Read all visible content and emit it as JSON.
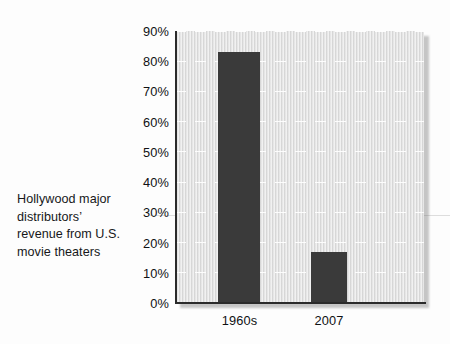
{
  "caption": {
    "lines": [
      "Hollywood major",
      "distributors’",
      "revenue from U.S.",
      "movie theaters"
    ]
  },
  "chart_data": {
    "type": "bar",
    "title": "",
    "subtitle": "",
    "xlabel": "",
    "ylabel": "",
    "categories": [
      "1960s",
      "2007"
    ],
    "values": [
      83,
      17
    ],
    "ylim": [
      0,
      90
    ],
    "ytick_labels": [
      "0%",
      "10%",
      "20%",
      "30%",
      "40%",
      "50%",
      "60%",
      "70%",
      "80%",
      "90%"
    ],
    "ytick_values": [
      0,
      10,
      20,
      30,
      40,
      50,
      60,
      70,
      80,
      90
    ],
    "grid": true,
    "grid_style": "dashed-white-horizontal",
    "legend": "none",
    "series": [
      {
        "name": "Share of revenue",
        "values": [
          83,
          17
        ]
      }
    ],
    "annotations": [],
    "colors": {
      "bar": "#3a3a3a",
      "plot_background": "#e3e3e3",
      "page_background": "#fdfdfd",
      "axis": "#2b2b2b",
      "gridline": "#ffffff",
      "text": "#101214"
    }
  }
}
